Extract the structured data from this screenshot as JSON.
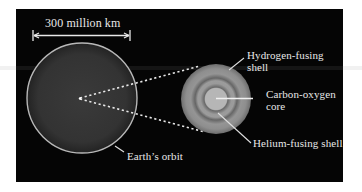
{
  "figure": {
    "scale_bar_label": "300 million km",
    "earth_orbit_label": "Earth’s orbit",
    "hydrogen_shell_label_line1": "Hydrogen-fusing",
    "hydrogen_shell_label_line2": "shell",
    "core_label_line1": "Carbon-oxygen",
    "core_label_line2": "core",
    "helium_shell_label": "Helium-fusing shell"
  },
  "colors": {
    "background": "#050505",
    "orbit_fill": "#333333",
    "orbit_stroke": "#b8b8b8",
    "text": "#e8e8e8",
    "star_outer": "#8a8a8a",
    "star_core": "#b4b4b4"
  }
}
